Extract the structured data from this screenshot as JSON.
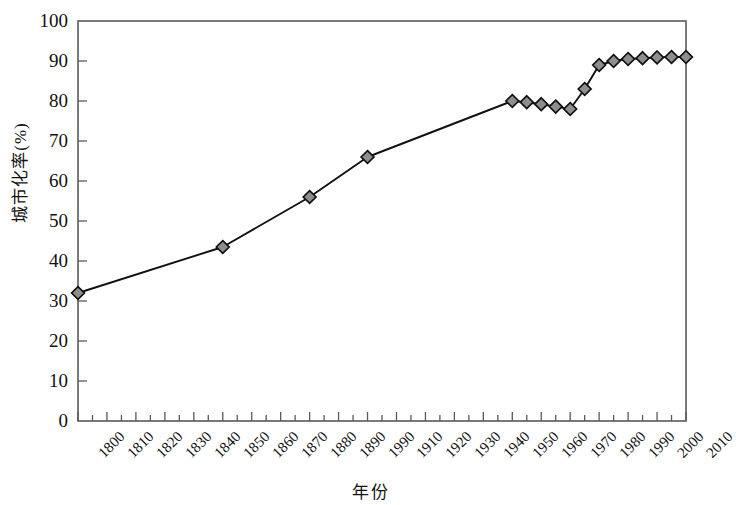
{
  "chart_data": {
    "type": "line",
    "title": "",
    "xlabel": "年份",
    "ylabel": "城市化率(%)",
    "xlim": [
      1800,
      2010
    ],
    "ylim": [
      0,
      100
    ],
    "grid": false,
    "legend": "none",
    "marker": "diamond",
    "marker_fill": "#8e8e8e",
    "marker_edge": "#111111",
    "line_color": "#111111",
    "y_ticks": [
      0,
      10,
      20,
      30,
      40,
      50,
      60,
      70,
      80,
      90,
      100
    ],
    "x_tick_labels": [
      "1800",
      "1810",
      "1820",
      "1830",
      "1840",
      "1850",
      "1860",
      "1870",
      "1880",
      "1890",
      "1990",
      "1910",
      "1920",
      "1930",
      "1940",
      "1950",
      "1960",
      "1970",
      "1980",
      "1990",
      "2000",
      "2010"
    ],
    "x": [
      1800,
      1850,
      1880,
      1900,
      1950,
      1955,
      1960,
      1965,
      1970,
      1975,
      1980,
      1985,
      1990,
      1995,
      2000,
      2005,
      2010
    ],
    "values": [
      32,
      43.5,
      56,
      66,
      80,
      79.7,
      79.2,
      78.6,
      78,
      83,
      89,
      90,
      90.5,
      90.7,
      90.9,
      91,
      91
    ],
    "series": [
      {
        "name": "城市化率",
        "points": [
          {
            "x": 1800,
            "y": 32
          },
          {
            "x": 1850,
            "y": 43.5
          },
          {
            "x": 1880,
            "y": 56
          },
          {
            "x": 1900,
            "y": 66
          },
          {
            "x": 1950,
            "y": 80
          },
          {
            "x": 1955,
            "y": 79.7
          },
          {
            "x": 1960,
            "y": 79.2
          },
          {
            "x": 1965,
            "y": 78.6
          },
          {
            "x": 1970,
            "y": 78
          },
          {
            "x": 1975,
            "y": 83
          },
          {
            "x": 1980,
            "y": 89
          },
          {
            "x": 1985,
            "y": 90
          },
          {
            "x": 1990,
            "y": 90.5
          },
          {
            "x": 1995,
            "y": 90.7
          },
          {
            "x": 2000,
            "y": 90.9
          },
          {
            "x": 2005,
            "y": 91
          },
          {
            "x": 2010,
            "y": 91
          }
        ]
      }
    ]
  }
}
